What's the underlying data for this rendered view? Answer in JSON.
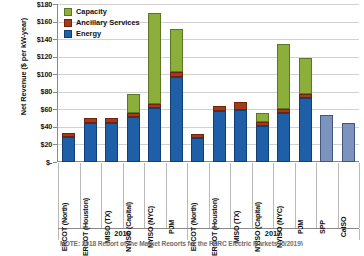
{
  "chart_data": {
    "type": "bar",
    "title": "",
    "subtitle": "",
    "xlabel": "",
    "ylabel": "Net Revenue ($ per kW-year)",
    "ylim": [
      0,
      180
    ],
    "ytick_values": [
      0,
      20,
      40,
      60,
      80,
      100,
      120,
      140,
      160,
      180
    ],
    "ytick_labels": [
      "$-",
      "$20",
      "$40",
      "$60",
      "$80",
      "$100",
      "$120",
      "$140",
      "$160",
      "$180"
    ],
    "grid": true,
    "stacked": true,
    "legend_position": "top-left",
    "legend": [
      "Capacity",
      "Ancillary Services",
      "Energy"
    ],
    "groups": [
      "2016",
      "2017"
    ],
    "categories": [
      "ERCOT (North)",
      "ERCOT (Houston)",
      "MISO (TX)",
      "NYISO (Capital)",
      "NYISO (NYC)",
      "PJM",
      "ERCOT (North)",
      "ERCOT (Houston)",
      "MISO (TX)",
      "NYISO (Capital)",
      "NYISO (NYC)",
      "PJM",
      "SPP",
      "CAISO"
    ],
    "series": [
      {
        "name": "Energy",
        "color": "#1F5FA8",
        "values": [
          28,
          45,
          44,
          51,
          62,
          97,
          27,
          58,
          59,
          41,
          56,
          73,
          53,
          44
        ]
      },
      {
        "name": "Ancillary Services",
        "color": "#A63A18",
        "values": [
          5,
          5,
          6,
          5,
          4,
          5,
          5,
          6,
          9,
          5,
          4,
          5,
          0,
          0
        ]
      },
      {
        "name": "Capacity",
        "color": "#8CAF3C",
        "values": [
          0,
          0,
          0,
          21,
          104,
          49,
          0,
          0,
          0,
          10,
          74,
          40,
          0,
          0
        ]
      }
    ],
    "totals": [
      33,
      50,
      50,
      77,
      170,
      151,
      32,
      64,
      68,
      56,
      134,
      118,
      53,
      44
    ]
  },
  "axis": {
    "y_title": "Net Revenue ($ per kW-year)"
  },
  "legend": {
    "items": [
      {
        "label": "Capacity",
        "color": "#8CAF3C"
      },
      {
        "label": "Ancillary Services",
        "color": "#A63A18"
      },
      {
        "label": "Energy",
        "color": "#1F5FA8"
      }
    ]
  },
  "ytick_labels": [
    "$180",
    "$160",
    "$140",
    "$120",
    "$100",
    "$80",
    "$60",
    "$40",
    "$20",
    "$-"
  ],
  "categories_2016": [
    "ERCOT (North)",
    "ERCOT (Houston)",
    "MISO (TX)",
    "NYISO (Capital)",
    "NYISO (NYC)",
    "PJM"
  ],
  "categories_2017": [
    "ERCOT (North)",
    "ERCOT (Houston)",
    "MISO (TX)",
    "NYISO (Capital)",
    "NYISO (NYC)",
    "PJM",
    "SPP",
    "CaISO"
  ],
  "years": [
    "2016",
    "2017"
  ],
  "source_note": "NOTE: 2018 Report of the Market Reports for the FERC Electric Markets (5/2019)"
}
